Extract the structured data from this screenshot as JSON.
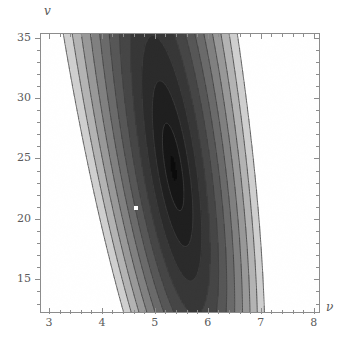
{
  "figure": {
    "type": "contour-plot",
    "background_color": "#ffffff",
    "frame_color": "#8c8c8c",
    "title": ""
  },
  "axes": {
    "x": {
      "label": "ν",
      "label_name": "greek-nu",
      "min": 2.85,
      "max": 8.1,
      "major_ticks": [
        3,
        4,
        5,
        6,
        7,
        8
      ],
      "tick_labels": [
        "3",
        "4",
        "5",
        "6",
        "7",
        "8"
      ],
      "minor_per_interval": 4
    },
    "y": {
      "label": "v",
      "label_name": "italic-v",
      "min": 12.3,
      "max": 35.3,
      "major_ticks": [
        15,
        20,
        25,
        30,
        35
      ],
      "tick_labels": [
        "15",
        "20",
        "25",
        "30",
        "35"
      ],
      "minor_per_interval": 4
    }
  },
  "marker": {
    "name": "optimum-point",
    "x": 4.65,
    "y": 20.9,
    "color": "#ffffff",
    "size_px": 4
  },
  "chart_data": {
    "type": "heatmap",
    "title": "",
    "xlabel": "ν",
    "ylabel": "v",
    "xlim": [
      2.85,
      8.1
    ],
    "ylim": [
      12.3,
      35.3
    ],
    "grid": false,
    "legend": "none",
    "colormap": "grayscale-inverted",
    "contour_levels": [
      0,
      1,
      2,
      3,
      4,
      5,
      6,
      7,
      8,
      9,
      10
    ],
    "band_colors": [
      "#0a0a0a",
      "#151515",
      "#1e1e1e",
      "#2a2a2a",
      "#363636",
      "#454545",
      "#565656",
      "#6a6a6a",
      "#808080",
      "#989898",
      "#b3b3b3",
      "#cfcfcf"
    ],
    "contour_line_color": "#3c3c3c",
    "annotations": [
      {
        "label": "white point marker",
        "x": 4.65,
        "y": 20.9
      }
    ],
    "series": [
      {
        "name": "field-level-bands",
        "note": "Values are relative contour-level indices (0 = darkest core).",
        "sample_grid_x": [
          3,
          4,
          5,
          6,
          7,
          8
        ],
        "sample_grid_y": [
          35,
          30,
          25,
          20,
          15
        ],
        "values": [
          [
            9,
            5,
            1,
            0,
            0,
            1
          ],
          [
            6,
            2,
            0,
            0,
            0,
            1
          ],
          [
            3,
            0,
            0,
            0,
            1,
            3
          ],
          [
            1,
            0,
            0,
            1,
            3,
            6
          ],
          [
            1,
            0,
            1,
            3,
            6,
            9
          ]
        ]
      }
    ]
  }
}
